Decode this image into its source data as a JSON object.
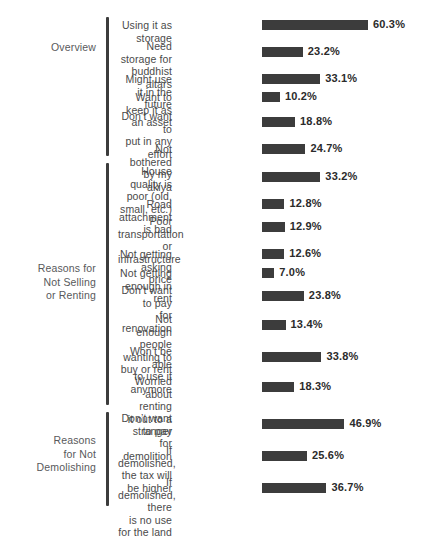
{
  "chart_data": {
    "type": "bar",
    "orientation": "horizontal",
    "title": "",
    "subtitle": "",
    "xlabel": "",
    "ylabel": "",
    "xlim": [
      0,
      65
    ],
    "grid": false,
    "legend": null,
    "value_format": "percent",
    "bar_color": "#3c3c3c",
    "label_color": "#4a4a4a",
    "group_label_color": "#58595b",
    "groups": [
      {
        "name": "Overview",
        "label": "Overview",
        "categories": [
          "Using it as storage",
          "Need storage for\nbuddhist altars",
          "Might use it in the future",
          "Want to keep it as an asset",
          "Don’t want to\nput in any effort",
          "Not bothered by my akiya"
        ],
        "values": [
          60.3,
          23.2,
          33.1,
          10.2,
          18.8,
          24.7
        ],
        "value_labels": [
          "60.3%",
          "23.2%",
          "33.1%",
          "10.2%",
          "18.8%",
          "24.7%"
        ]
      },
      {
        "name": "Reasons for Not Selling or Renting",
        "label": "Reasons for\nNot Selling\nor Renting",
        "categories": [
          "House quality is\npoor (old, small, etc.)",
          "Road attachment is bad",
          "Poor transportation\nor infrastructure",
          "Not getting asking price",
          "Not getting enough in rent",
          "Don’t want to pay\nfor renovation",
          "Not enough people\nwanting to buy or rent",
          "Won’t be able\nto use it anymore",
          "Worried about renting\nit out to a stranger"
        ],
        "values": [
          33.2,
          12.8,
          12.9,
          12.6,
          7.0,
          23.8,
          13.4,
          33.8,
          18.3
        ],
        "value_labels": [
          "33.2%",
          "12.8%",
          "12.9%",
          "12.6%",
          "7.0%",
          "23.8%",
          "13.4%",
          "33.8%",
          "18.3%"
        ]
      },
      {
        "name": "Reasons for Not Demolishing",
        "label": "Reasons\nfor Not\nDemolishing",
        "categories": [
          "Don’t want to pay\nfor demolition",
          "If demolished,\nthe tax will be higher",
          "If demolished, there\nis no use for the land"
        ],
        "values": [
          46.9,
          25.6,
          36.7
        ],
        "value_labels": [
          "46.9%",
          "25.6%",
          "36.7%"
        ]
      }
    ]
  },
  "layout": {
    "px_per_percent": 1.757,
    "bar_left_px": 262,
    "rows": [
      {
        "group": 0,
        "index": 0,
        "top": 20
      },
      {
        "group": 0,
        "index": 1,
        "top": 47
      },
      {
        "group": 0,
        "index": 2,
        "top": 74
      },
      {
        "group": 0,
        "index": 3,
        "top": 92
      },
      {
        "group": 0,
        "index": 4,
        "top": 117
      },
      {
        "group": 0,
        "index": 5,
        "top": 144
      },
      {
        "group": 1,
        "index": 0,
        "top": 172
      },
      {
        "group": 1,
        "index": 1,
        "top": 199
      },
      {
        "group": 1,
        "index": 2,
        "top": 222
      },
      {
        "group": 1,
        "index": 3,
        "top": 249
      },
      {
        "group": 1,
        "index": 4,
        "top": 268
      },
      {
        "group": 1,
        "index": 5,
        "top": 291
      },
      {
        "group": 1,
        "index": 6,
        "top": 320
      },
      {
        "group": 1,
        "index": 7,
        "top": 352
      },
      {
        "group": 1,
        "index": 8,
        "top": 382
      },
      {
        "group": 2,
        "index": 0,
        "top": 419
      },
      {
        "group": 2,
        "index": 1,
        "top": 451
      },
      {
        "group": 2,
        "index": 2,
        "top": 483
      }
    ],
    "brackets": [
      {
        "group": 0,
        "top": 17,
        "height": 139,
        "label_top": 41
      },
      {
        "group": 1,
        "top": 163,
        "height": 242,
        "label_top": 262
      },
      {
        "group": 2,
        "top": 412,
        "height": 94,
        "label_top": 434
      }
    ]
  }
}
